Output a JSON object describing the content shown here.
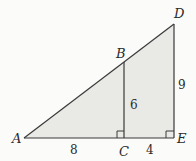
{
  "diagram": {
    "type": "similar-right-triangles",
    "points": {
      "A": {
        "label": "A"
      },
      "B": {
        "label": "B"
      },
      "C": {
        "label": "C"
      },
      "D": {
        "label": "D"
      },
      "E": {
        "label": "E"
      }
    },
    "measures": {
      "AC": "8",
      "CE": "4",
      "BC": "6",
      "DE": "9"
    },
    "right_angles": [
      "C",
      "E"
    ],
    "colors": {
      "fill": "#e9e9e6",
      "stroke": "#3a3a3a",
      "background": "#fbfbf9"
    }
  }
}
